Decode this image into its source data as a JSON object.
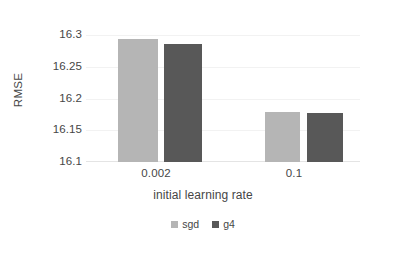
{
  "chart_data": {
    "type": "bar",
    "title": "",
    "xlabel": "initial learning rate",
    "ylabel": "RMSE",
    "categories": [
      "0.002",
      "0.1"
    ],
    "series": [
      {
        "name": "sgd",
        "values": [
          16.291,
          16.179
        ],
        "color": "#b5b5b5"
      },
      {
        "name": "g4",
        "values": [
          16.276,
          16.176
        ],
        "color": "#585858"
      }
    ],
    "ylim": [
      16.1,
      16.3
    ],
    "yticks": [
      "16.3",
      "16.25",
      "16.2",
      "16.15",
      "16.1"
    ],
    "ytick_values": [
      16.3,
      16.25,
      16.2,
      16.15,
      16.1
    ],
    "grid": true,
    "legend_position": "bottom"
  },
  "bars": [
    {
      "name": "sgd-0.002",
      "series": "sgd",
      "category": "0.002",
      "value": 16.291,
      "color": "#b5b5b5",
      "left": 32,
      "width": 40,
      "height": 123
    },
    {
      "name": "g4-0.002",
      "series": "g4",
      "category": "0.002",
      "value": 16.276,
      "color": "#585858",
      "left": 78,
      "width": 38,
      "height": 118
    },
    {
      "name": "sgd-0.1",
      "series": "sgd",
      "category": "0.1",
      "value": 16.179,
      "color": "#b5b5b5",
      "left": 179,
      "width": 35,
      "height": 50
    },
    {
      "name": "g4-0.1",
      "series": "g4",
      "category": "0.1",
      "value": 16.176,
      "color": "#585858",
      "left": 221,
      "width": 36,
      "height": 49
    }
  ],
  "gridlines": [
    0,
    31.75,
    63.5,
    95.25
  ],
  "xticks": [
    {
      "label": "0.002",
      "left": 96,
      "width": 120
    },
    {
      "label": "0.1",
      "left": 234,
      "width": 120
    }
  ],
  "yticks": [
    {
      "label": "16.3",
      "top": 29
    },
    {
      "label": "16.25",
      "top": 61
    },
    {
      "label": "16.2",
      "top": 93
    },
    {
      "label": "16.15",
      "top": 124
    },
    {
      "label": "16.1",
      "top": 156
    }
  ],
  "axis": {
    "y_title": "RMSE",
    "x_title": "initial learning rate"
  },
  "legend": {
    "items": [
      {
        "label": "sgd",
        "color": "#b5b5b5"
      },
      {
        "label": "g4",
        "color": "#585858"
      }
    ]
  }
}
